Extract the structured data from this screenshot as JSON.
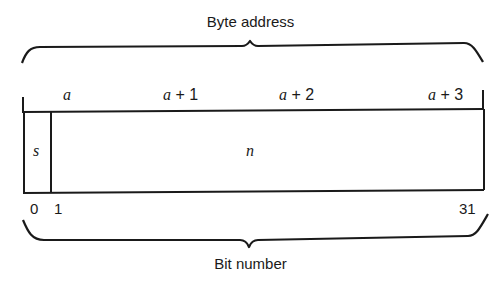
{
  "diagram": {
    "top_label": "Byte address",
    "bottom_label": "Bit number",
    "byte_addresses": [
      {
        "var": "a",
        "op": "",
        "num": ""
      },
      {
        "var": "a",
        "op": " + ",
        "num": "1"
      },
      {
        "var": "a",
        "op": " + ",
        "num": "2"
      },
      {
        "var": "a",
        "op": " + ",
        "num": "3"
      }
    ],
    "fields": [
      {
        "name": "s",
        "bits": "0"
      },
      {
        "name": "n",
        "bits": "1-31"
      }
    ],
    "bit_numbers": [
      "0",
      "1",
      "31"
    ],
    "stroke_color": "#1a1a1a"
  }
}
